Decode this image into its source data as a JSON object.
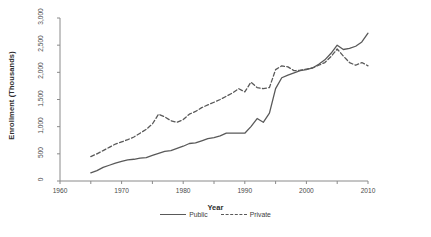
{
  "chart_data": {
    "type": "line",
    "title": "",
    "xlabel": "Year",
    "ylabel": "Enrollment (Thousands)",
    "xlim": [
      1960,
      2010
    ],
    "ylim": [
      0,
      3000
    ],
    "xticks": [
      1960,
      1965,
      1970,
      1975,
      1980,
      1985,
      1990,
      1995,
      2000,
      2005,
      2010
    ],
    "xtick_labels": [
      "1960",
      "",
      "1970",
      "",
      "1980",
      "",
      "1990",
      "",
      "2000",
      "",
      "2010"
    ],
    "yticks": [
      0,
      500,
      1000,
      1500,
      2000,
      2500,
      3000
    ],
    "ytick_labels": [
      "0",
      "500",
      "1,000",
      "1,500",
      "2,000",
      "2,500",
      "3,000"
    ],
    "grid": false,
    "legend_position": "bottom",
    "x": [
      1965,
      1966,
      1967,
      1968,
      1969,
      1970,
      1971,
      1972,
      1973,
      1974,
      1975,
      1976,
      1977,
      1978,
      1979,
      1980,
      1981,
      1982,
      1983,
      1984,
      1985,
      1986,
      1987,
      1988,
      1989,
      1990,
      1991,
      1992,
      1993,
      1994,
      1995,
      1996,
      1997,
      1998,
      1999,
      2000,
      2001,
      2002,
      2003,
      2004,
      2005,
      2006,
      2007,
      2008,
      2009,
      2010
    ],
    "series": [
      {
        "name": "Public",
        "style": "solid",
        "color": "#595959",
        "values": [
          150,
          190,
          250,
          290,
          330,
          360,
          390,
          400,
          420,
          430,
          470,
          510,
          545,
          560,
          600,
          640,
          690,
          700,
          740,
          780,
          800,
          830,
          880,
          880,
          880,
          880,
          1000,
          1150,
          1080,
          1250,
          1700,
          1900,
          1950,
          1990,
          2030,
          2050,
          2080,
          2150,
          2230,
          2350,
          2500,
          2420,
          2440,
          2480,
          2560,
          2720
        ]
      },
      {
        "name": "Private",
        "style": "dashed",
        "color": "#595959",
        "values": [
          450,
          500,
          560,
          620,
          680,
          720,
          760,
          810,
          880,
          950,
          1050,
          1230,
          1180,
          1110,
          1080,
          1130,
          1230,
          1280,
          1350,
          1400,
          1450,
          1500,
          1560,
          1620,
          1700,
          1640,
          1820,
          1720,
          1700,
          1720,
          2050,
          2120,
          2100,
          2030,
          2040,
          2060,
          2080,
          2130,
          2180,
          2290,
          2430,
          2300,
          2180,
          2130,
          2180,
          2120
        ]
      }
    ]
  },
  "legend": {
    "items": [
      {
        "label": "Public",
        "style": "solid"
      },
      {
        "label": "Private",
        "style": "dashed"
      }
    ]
  }
}
